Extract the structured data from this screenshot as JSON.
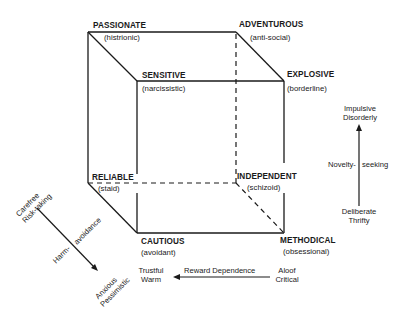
{
  "cube": {
    "vertices": {
      "back_top_left": {
        "label": "PASSIONATE",
        "sub": "(histrionic)"
      },
      "back_top_right": {
        "label": "ADVENTUROUS",
        "sub": "(anti-social)"
      },
      "front_top_left": {
        "label": "SENSITIVE",
        "sub": "(narcissistic)"
      },
      "front_top_right": {
        "label": "EXPLOSIVE",
        "sub": "(borderline)"
      },
      "back_bottom_left": {
        "label": "RELIABLE",
        "sub": "(staid)"
      },
      "back_bottom_right": {
        "label": "INDEPENDENT",
        "sub": "(schizoid)"
      },
      "front_bottom_left": {
        "label": "CAUTIOUS",
        "sub": "(avoidant)"
      },
      "front_bottom_right": {
        "label": "METHODICAL",
        "sub": "(obsessional)"
      }
    }
  },
  "axes": {
    "novelty_seeking": {
      "name_left": "Novelty-",
      "name_right": "seeking",
      "high_line1": "Impulsive",
      "high_line2": "Disorderly",
      "low_line1": "Deliberate",
      "low_line2": "Thrifty"
    },
    "harm_avoidance": {
      "name_left": "Harm-",
      "name_right": "avoidance",
      "low_line1": "Carefree",
      "low_line2": "Risk-taking",
      "high_line1": "Anxious",
      "high_line2": "Pessimistic"
    },
    "reward_dependence": {
      "name": "Reward Dependence",
      "high_line1": "Trustful",
      "high_line2": "Warm",
      "low_line1": "Aloof",
      "low_line2": "Critical"
    }
  },
  "colors": {
    "ink": "#1a1a1a",
    "background": "#ffffff"
  }
}
